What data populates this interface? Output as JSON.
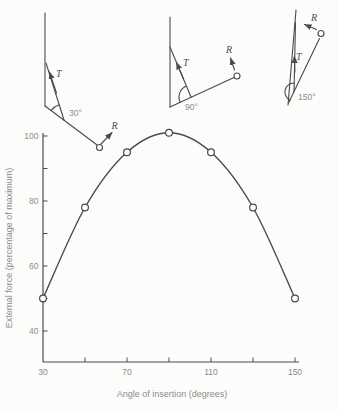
{
  "figure": {
    "background": "#fcfcfb",
    "line_color": "#4a4a4a",
    "text_color": "#8c8c8c",
    "vector_label_color": "#4f4f4f"
  },
  "diagrams": [
    {
      "angle_label": "30°",
      "t_label": "T",
      "r_label": "R"
    },
    {
      "angle_label": "90°",
      "t_label": "T",
      "r_label": "R"
    },
    {
      "angle_label": "150°",
      "t_label": "T",
      "r_label": "R"
    }
  ],
  "chart_data": {
    "type": "line",
    "x": [
      30,
      50,
      70,
      90,
      110,
      130,
      150
    ],
    "y": [
      50,
      78,
      95,
      101,
      95,
      78,
      50
    ],
    "series_name": "External force",
    "marker": "open-circle",
    "title": "",
    "xlabel": "Angle of insertion (degrees)",
    "ylabel": "External force (percentage of maximum)",
    "x_ticks": [
      30,
      50,
      70,
      90,
      110,
      130,
      150
    ],
    "x_tick_labels": [
      "30",
      "70",
      "110",
      "150"
    ],
    "x_tick_label_values": [
      30,
      70,
      110,
      150
    ],
    "y_ticks": [
      40,
      50,
      60,
      70,
      80,
      90,
      100
    ],
    "y_tick_labels": [
      "40",
      "60",
      "80",
      "100"
    ],
    "y_tick_label_values": [
      40,
      60,
      80,
      100
    ],
    "xlim": [
      30,
      152
    ],
    "ylim": [
      31,
      102.5
    ],
    "grid": false,
    "legend": "none"
  }
}
